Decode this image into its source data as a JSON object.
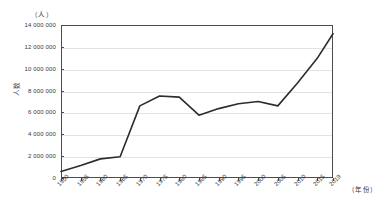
{
  "top_strip_text": "",
  "axes": {
    "y_unit_label": "（人）",
    "y_axis_title": "人数",
    "x_unit_label": "（年份）",
    "y_tick_labels": [
      "0",
      "2 000 000",
      "4 000 000",
      "6 000 000",
      "8 000 000",
      "10 000 000",
      "12 000 000",
      "14 000 000"
    ],
    "x_tick_labels": [
      "1950",
      "1955",
      "1960",
      "1965",
      "1970",
      "1975",
      "1980",
      "1985",
      "1990",
      "1995",
      "2000",
      "2005",
      "2010",
      "2015",
      "2019"
    ]
  },
  "style": {
    "line_color": "#2b2b30",
    "grid_color": "#e3e3e6",
    "axis_color": "#4b4b50"
  },
  "chart_data": {
    "type": "line",
    "title": "",
    "xlabel": "（年份）",
    "ylabel": "人数",
    "y_unit": "（人）",
    "grid": true,
    "legend": "none",
    "xlim": [
      1950,
      2019
    ],
    "ylim": [
      0,
      14000000
    ],
    "y_ticks": [
      0,
      2000000,
      4000000,
      6000000,
      8000000,
      10000000,
      12000000,
      14000000
    ],
    "x_ticks": [
      1950,
      1955,
      1960,
      1965,
      1970,
      1975,
      1980,
      1985,
      1990,
      1995,
      2000,
      2005,
      2010,
      2015,
      2019
    ],
    "x": [
      1950,
      1955,
      1960,
      1965,
      1970,
      1975,
      1980,
      1985,
      1990,
      1995,
      2000,
      2005,
      2010,
      2015,
      2019
    ],
    "values": [
      600000,
      1150000,
      1750000,
      1950000,
      6600000,
      7500000,
      7400000,
      5750000,
      6350000,
      6800000,
      7000000,
      6600000,
      8700000,
      10950000,
      13200000
    ],
    "series": [
      {
        "name": "人数",
        "values": [
          600000,
          1150000,
          1750000,
          1950000,
          6600000,
          7500000,
          7400000,
          5750000,
          6350000,
          6800000,
          7000000,
          6600000,
          8700000,
          10950000,
          13200000
        ]
      }
    ]
  }
}
